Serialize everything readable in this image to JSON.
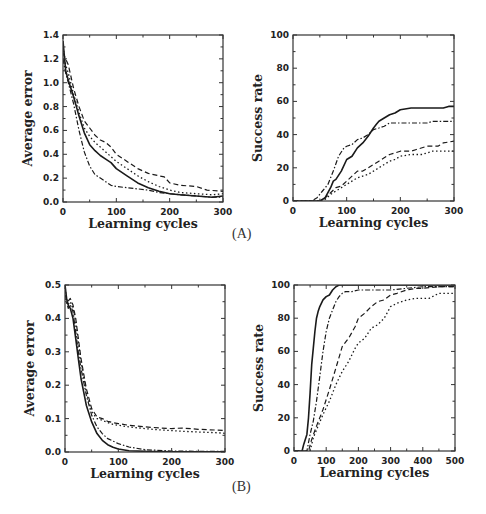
{
  "panels": {
    "a_label": "(A)",
    "b_label": "(B)"
  },
  "styles": {
    "line_color": "#1a1a1a",
    "frame_color": "#333333"
  },
  "chart_data": [
    {
      "id": "A-left",
      "panel": "A",
      "type": "line",
      "title": "",
      "xlabel": "Learning cycles",
      "ylabel": "Average error",
      "xlim": [
        0,
        300
      ],
      "ylim": [
        0,
        1.4
      ],
      "xticks": [
        0,
        100,
        200,
        300
      ],
      "yticks": [
        0.0,
        0.2,
        0.4,
        0.6,
        0.8,
        1.0,
        1.2,
        1.4
      ],
      "ytick_labels": [
        "0.0",
        "0.2",
        "0.4",
        "0.6",
        "0.8",
        "1.0",
        "1.2",
        "1.4"
      ],
      "grid": false,
      "legend": null,
      "frame": {
        "x0": 63,
        "y0": 35,
        "x1": 223,
        "y1": 202
      },
      "series": [
        {
          "name": "solid",
          "dash": "none",
          "width": 1.6,
          "x": [
            0,
            5,
            10,
            20,
            30,
            40,
            50,
            60,
            70,
            80,
            90,
            100,
            120,
            140,
            160,
            180,
            200,
            220,
            250,
            280,
            300
          ],
          "y": [
            1.35,
            1.1,
            1.02,
            0.88,
            0.72,
            0.58,
            0.48,
            0.43,
            0.39,
            0.36,
            0.33,
            0.28,
            0.22,
            0.16,
            0.12,
            0.09,
            0.07,
            0.06,
            0.05,
            0.04,
            0.05
          ]
        },
        {
          "name": "dashed",
          "dash": "5,3",
          "width": 1.2,
          "x": [
            0,
            5,
            10,
            20,
            30,
            40,
            50,
            60,
            70,
            80,
            90,
            100,
            120,
            140,
            160,
            180,
            190,
            200,
            220,
            250,
            270,
            300
          ],
          "y": [
            1.25,
            1.2,
            1.15,
            0.95,
            0.8,
            0.68,
            0.62,
            0.56,
            0.52,
            0.5,
            0.46,
            0.4,
            0.34,
            0.28,
            0.24,
            0.22,
            0.21,
            0.16,
            0.14,
            0.13,
            0.1,
            0.09
          ]
        },
        {
          "name": "dotted",
          "dash": "1.5,2.5",
          "width": 1.3,
          "x": [
            0,
            5,
            10,
            20,
            30,
            40,
            50,
            60,
            70,
            80,
            90,
            100,
            120,
            140,
            160,
            180,
            200,
            220,
            250,
            280,
            300
          ],
          "y": [
            1.3,
            1.15,
            1.08,
            0.9,
            0.75,
            0.62,
            0.55,
            0.5,
            0.46,
            0.42,
            0.38,
            0.34,
            0.28,
            0.22,
            0.17,
            0.13,
            0.1,
            0.08,
            0.07,
            0.06,
            0.07
          ]
        },
        {
          "name": "dash-dot",
          "dash": "5,2,1.5,2",
          "width": 1.2,
          "x": [
            0,
            5,
            10,
            20,
            30,
            40,
            50,
            60,
            70,
            80,
            90,
            100,
            120,
            140,
            160,
            180,
            200,
            220,
            250,
            280,
            300
          ],
          "y": [
            1.2,
            1.08,
            1.0,
            0.82,
            0.6,
            0.42,
            0.3,
            0.23,
            0.2,
            0.17,
            0.14,
            0.13,
            0.12,
            0.11,
            0.1,
            0.08,
            0.07,
            0.06,
            0.05,
            0.04,
            0.04
          ]
        }
      ]
    },
    {
      "id": "A-right",
      "panel": "A",
      "type": "line",
      "title": "",
      "xlabel": "Learning cycles",
      "ylabel": "Success rate",
      "xlim": [
        0,
        300
      ],
      "ylim": [
        0,
        100
      ],
      "xticks": [
        0,
        100,
        200,
        300
      ],
      "yticks": [
        0,
        20,
        40,
        60,
        80,
        100
      ],
      "ytick_labels": [
        "0",
        "20",
        "40",
        "60",
        "80",
        "100"
      ],
      "grid": false,
      "legend": null,
      "frame": {
        "x0": 293,
        "y0": 35,
        "x1": 454,
        "y1": 201
      },
      "series": [
        {
          "name": "solid",
          "dash": "none",
          "width": 1.6,
          "x": [
            0,
            50,
            60,
            70,
            75,
            80,
            90,
            100,
            110,
            120,
            130,
            140,
            150,
            155,
            160,
            170,
            180,
            190,
            200,
            220,
            250,
            280,
            290,
            300
          ],
          "y": [
            0,
            0,
            2,
            8,
            12,
            13,
            18,
            25,
            27,
            32,
            35,
            39,
            44,
            46,
            48,
            50,
            52,
            53,
            55,
            56,
            56,
            56,
            57,
            57
          ]
        },
        {
          "name": "dash-dot",
          "dash": "5,2,1.5,2",
          "width": 1.2,
          "x": [
            0,
            35,
            45,
            55,
            65,
            75,
            85,
            95,
            100,
            110,
            120,
            130,
            140,
            150,
            160,
            170,
            180,
            200,
            220,
            250,
            260,
            300
          ],
          "y": [
            0,
            0,
            2,
            6,
            10,
            18,
            27,
            32,
            33,
            34,
            37,
            38,
            40,
            43,
            44,
            45,
            47,
            47,
            47,
            47,
            48,
            48
          ]
        },
        {
          "name": "dashed",
          "dash": "5,3",
          "width": 1.2,
          "x": [
            0,
            55,
            60,
            70,
            80,
            90,
            100,
            110,
            120,
            130,
            140,
            150,
            160,
            170,
            180,
            190,
            200,
            220,
            230,
            250,
            270,
            280,
            300
          ],
          "y": [
            0,
            0,
            2,
            5,
            8,
            9,
            12,
            15,
            18,
            18,
            20,
            22,
            24,
            26,
            28,
            29,
            30,
            30,
            31,
            33,
            33,
            35,
            36
          ]
        },
        {
          "name": "dotted",
          "dash": "1.5,2.5",
          "width": 1.3,
          "x": [
            0,
            50,
            60,
            70,
            80,
            90,
            100,
            110,
            120,
            130,
            140,
            150,
            160,
            170,
            180,
            190,
            200,
            220,
            240,
            260,
            280,
            300
          ],
          "y": [
            0,
            0,
            1,
            4,
            6,
            8,
            10,
            12,
            14,
            15,
            16,
            18,
            20,
            22,
            24,
            25,
            27,
            28,
            28,
            30,
            30,
            30
          ]
        }
      ]
    },
    {
      "id": "B-left",
      "panel": "B",
      "type": "line",
      "title": "",
      "xlabel": "Learning cycles",
      "ylabel": "Average error",
      "xlim": [
        0,
        300
      ],
      "ylim": [
        0,
        0.5
      ],
      "xticks": [
        0,
        100,
        200,
        300
      ],
      "yticks": [
        0.0,
        0.1,
        0.2,
        0.3,
        0.4,
        0.5
      ],
      "ytick_labels": [
        "0.0",
        "0.1",
        "0.2",
        "0.3",
        "0.4",
        "0.5"
      ],
      "grid": false,
      "legend": null,
      "frame": {
        "x0": 65,
        "y0": 285,
        "x1": 225,
        "y1": 452
      },
      "series": [
        {
          "name": "solid",
          "dash": "none",
          "width": 1.6,
          "x": [
            0,
            3,
            6,
            10,
            15,
            20,
            25,
            30,
            40,
            50,
            60,
            70,
            80,
            90,
            100,
            120,
            150,
            200,
            250,
            300
          ],
          "y": [
            0.5,
            0.46,
            0.44,
            0.43,
            0.4,
            0.34,
            0.28,
            0.22,
            0.14,
            0.09,
            0.055,
            0.035,
            0.022,
            0.014,
            0.009,
            0.004,
            0.002,
            0.001,
            0.001,
            0.001
          ]
        },
        {
          "name": "dash-dot",
          "dash": "5,2,1.5,2",
          "width": 1.2,
          "x": [
            0,
            3,
            6,
            10,
            15,
            20,
            25,
            30,
            40,
            50,
            60,
            70,
            80,
            100,
            120,
            150,
            200,
            250,
            300
          ],
          "y": [
            0.5,
            0.45,
            0.43,
            0.44,
            0.42,
            0.36,
            0.3,
            0.25,
            0.17,
            0.11,
            0.075,
            0.055,
            0.04,
            0.025,
            0.015,
            0.007,
            0.003,
            0.002,
            0.002
          ]
        },
        {
          "name": "dashed",
          "dash": "5,3",
          "width": 1.2,
          "x": [
            0,
            5,
            10,
            15,
            20,
            25,
            30,
            40,
            50,
            60,
            70,
            80,
            90,
            100,
            120,
            150,
            180,
            200,
            220,
            250,
            280,
            300
          ],
          "y": [
            0.47,
            0.45,
            0.46,
            0.44,
            0.4,
            0.34,
            0.28,
            0.19,
            0.13,
            0.105,
            0.1,
            0.092,
            0.088,
            0.085,
            0.08,
            0.075,
            0.072,
            0.07,
            0.072,
            0.068,
            0.066,
            0.064
          ]
        },
        {
          "name": "dotted",
          "dash": "1.5,2.5",
          "width": 1.3,
          "x": [
            0,
            5,
            10,
            15,
            20,
            25,
            30,
            40,
            50,
            60,
            70,
            80,
            90,
            100,
            120,
            150,
            180,
            200,
            220,
            250,
            280,
            300
          ],
          "y": [
            0.46,
            0.44,
            0.45,
            0.43,
            0.39,
            0.33,
            0.27,
            0.18,
            0.12,
            0.1,
            0.095,
            0.088,
            0.083,
            0.08,
            0.075,
            0.07,
            0.066,
            0.064,
            0.062,
            0.06,
            0.058,
            0.056
          ]
        }
      ]
    },
    {
      "id": "B-right",
      "panel": "B",
      "type": "line",
      "title": "",
      "xlabel": "Learning cycles",
      "ylabel": "Success rate",
      "xlim": [
        0,
        500
      ],
      "ylim": [
        0,
        100
      ],
      "xticks": [
        0,
        100,
        200,
        300,
        400,
        500
      ],
      "yticks": [
        0,
        20,
        40,
        60,
        80,
        100
      ],
      "ytick_labels": [
        "0",
        "20",
        "40",
        "60",
        "80",
        "100"
      ],
      "grid": false,
      "legend": null,
      "frame": {
        "x0": 294,
        "y0": 285,
        "x1": 455,
        "y1": 451
      },
      "series": [
        {
          "name": "solid",
          "dash": "none",
          "width": 1.6,
          "x": [
            0,
            25,
            30,
            40,
            45,
            50,
            55,
            60,
            65,
            70,
            75,
            80,
            90,
            100,
            110,
            120,
            130,
            140,
            150,
            500
          ],
          "y": [
            0,
            0,
            4,
            10,
            20,
            35,
            52,
            62,
            72,
            80,
            84,
            87,
            91,
            93,
            94,
            97,
            99,
            100,
            100,
            100
          ]
        },
        {
          "name": "dash-dot",
          "dash": "5,2,1.5,2",
          "width": 1.2,
          "x": [
            0,
            40,
            45,
            50,
            60,
            70,
            80,
            90,
            100,
            110,
            120,
            130,
            140,
            150,
            160,
            180,
            200,
            250,
            300,
            350,
            400,
            500
          ],
          "y": [
            0,
            0,
            5,
            10,
            18,
            30,
            45,
            60,
            72,
            80,
            85,
            90,
            93,
            95,
            96,
            96,
            97,
            97,
            97,
            98,
            99,
            99
          ]
        },
        {
          "name": "dashed",
          "dash": "5,3",
          "width": 1.2,
          "x": [
            0,
            45,
            55,
            70,
            90,
            110,
            130,
            150,
            170,
            190,
            200,
            220,
            240,
            260,
            280,
            300,
            320,
            350,
            380,
            400,
            450,
            500
          ],
          "y": [
            0,
            0,
            7,
            15,
            25,
            37,
            50,
            63,
            68,
            75,
            80,
            83,
            87,
            90,
            91,
            94,
            95,
            97,
            98,
            98,
            99,
            99
          ]
        },
        {
          "name": "dotted",
          "dash": "1.5,2.5",
          "width": 1.3,
          "x": [
            0,
            50,
            60,
            75,
            90,
            110,
            130,
            150,
            170,
            190,
            200,
            220,
            240,
            260,
            280,
            300,
            320,
            350,
            380,
            400,
            420,
            450,
            500
          ],
          "y": [
            0,
            0,
            8,
            15,
            22,
            30,
            40,
            48,
            54,
            62,
            65,
            68,
            74,
            76,
            80,
            87,
            89,
            91,
            92,
            92,
            92,
            95,
            95
          ]
        }
      ]
    }
  ]
}
